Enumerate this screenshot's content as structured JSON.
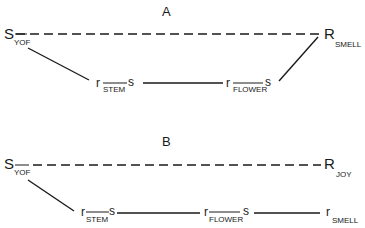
{
  "diagram": {
    "panels": [
      {
        "label": "A",
        "nodes": {
          "stimulus": {
            "main": "S",
            "sub": "YOF"
          },
          "response": {
            "main": "R",
            "sub": "SMELL"
          },
          "chain": [
            {
              "main": "r",
              "sub": "STEM",
              "tail": "s"
            },
            {
              "main": "r",
              "sub": "FLOWER",
              "tail": "s"
            }
          ]
        },
        "edges": [
          {
            "from": "S_YOF",
            "to": "R_SMELL",
            "style": "dashed"
          },
          {
            "from": "S_YOF",
            "to": "r_STEM s",
            "style": "solid"
          },
          {
            "from": "r_STEM s",
            "to": "r_FLOWER s",
            "style": "solid"
          },
          {
            "from": "r_FLOWER s",
            "to": "R_SMELL",
            "style": "solid"
          }
        ]
      },
      {
        "label": "B",
        "nodes": {
          "stimulus": {
            "main": "S",
            "sub": "YOF"
          },
          "response": {
            "main": "R",
            "sub": "JOY"
          },
          "chain": [
            {
              "main": "r",
              "sub": "STEM",
              "tail": "s"
            },
            {
              "main": "r",
              "sub": "FLOWER",
              "tail": "s"
            },
            {
              "main": "r",
              "sub": "SMELL",
              "tail": ""
            }
          ]
        },
        "edges": [
          {
            "from": "S_YOF",
            "to": "R_JOY",
            "style": "dashed"
          },
          {
            "from": "S_YOF",
            "to": "r_STEM s",
            "style": "solid"
          },
          {
            "from": "r_STEM s",
            "to": "r_FLOWER s",
            "style": "solid"
          },
          {
            "from": "r_FLOWER s",
            "to": "r_SMELL",
            "style": "solid"
          }
        ]
      }
    ]
  }
}
